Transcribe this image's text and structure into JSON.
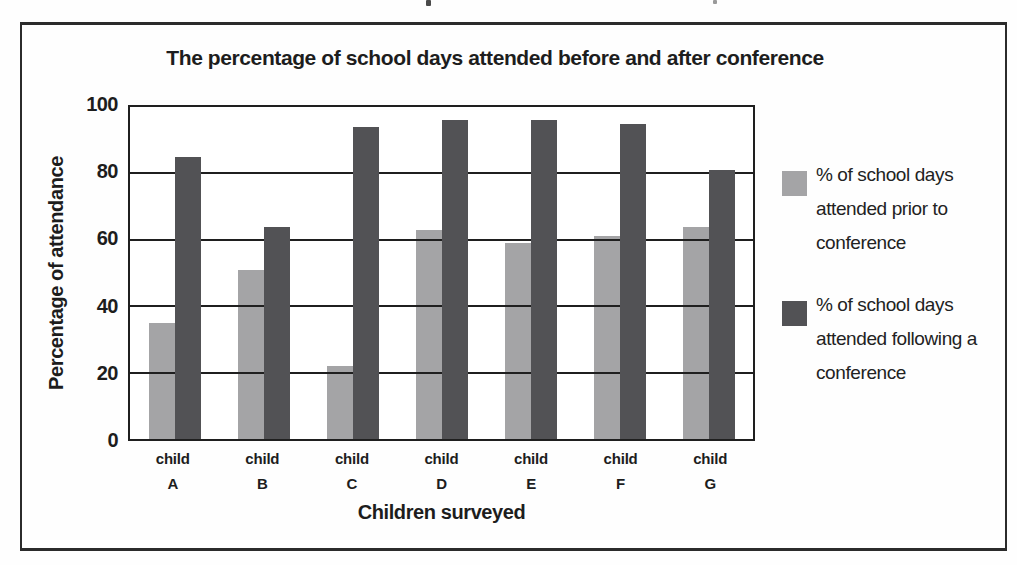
{
  "chart_data": {
    "type": "bar",
    "title": "The percentage of school days attended before and after conference",
    "xlabel": "Children surveyed",
    "ylabel": "Percentage of attendance",
    "ylim": [
      0,
      100
    ],
    "yticks": [
      0,
      20,
      40,
      60,
      80,
      100
    ],
    "grid": true,
    "legend_position": "right",
    "categories": [
      {
        "line1": "child",
        "line2": "A"
      },
      {
        "line1": "child",
        "line2": "B"
      },
      {
        "line1": "child",
        "line2": "C"
      },
      {
        "line1": "child",
        "line2": "D"
      },
      {
        "line1": "child",
        "line2": "E"
      },
      {
        "line1": "child",
        "line2": "F"
      },
      {
        "line1": "child",
        "line2": "G"
      }
    ],
    "series": [
      {
        "name": "% of school days attended prior to conference",
        "color": "#a4a4a6",
        "values": [
          35,
          51,
          22,
          63,
          59,
          61,
          64
        ]
      },
      {
        "name": "% of school days attended following a conference",
        "color": "#525255",
        "values": [
          85,
          64,
          94,
          96,
          96,
          95,
          81
        ]
      }
    ],
    "grid_color": "#1f1f1f",
    "background_color": "#ffffff"
  }
}
